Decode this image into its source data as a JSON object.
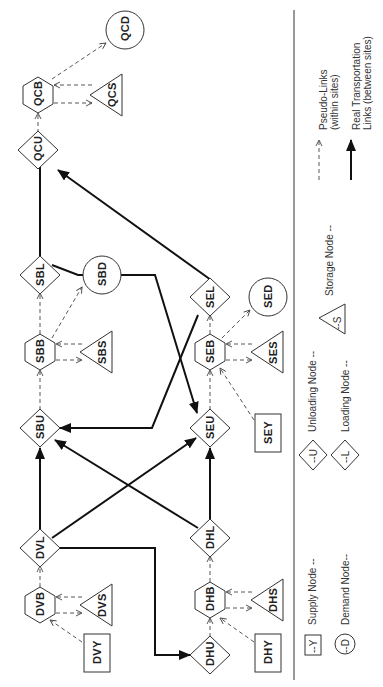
{
  "diagram": {
    "orientation": "rotated-90-ccw",
    "nodes": [
      {
        "id": "QCD",
        "type": "demand",
        "x": 125,
        "y": 30
      },
      {
        "id": "QCB",
        "type": "hub",
        "x": 38,
        "y": 95
      },
      {
        "id": "QCS",
        "type": "storage",
        "x": 107,
        "y": 95
      },
      {
        "id": "QCU",
        "type": "unloading",
        "x": 38,
        "y": 150
      },
      {
        "id": "SBL",
        "type": "loading",
        "x": 40,
        "y": 275
      },
      {
        "id": "SBD",
        "type": "demand",
        "x": 102,
        "y": 275
      },
      {
        "id": "SBB",
        "type": "hub",
        "x": 40,
        "y": 352
      },
      {
        "id": "SBS",
        "type": "storage",
        "x": 97,
        "y": 352
      },
      {
        "id": "SBU",
        "type": "unloading",
        "x": 40,
        "y": 428
      },
      {
        "id": "SEL",
        "type": "loading",
        "x": 210,
        "y": 297
      },
      {
        "id": "SED",
        "type": "demand",
        "x": 268,
        "y": 297
      },
      {
        "id": "SEB",
        "type": "hub",
        "x": 210,
        "y": 352
      },
      {
        "id": "SES",
        "type": "storage",
        "x": 268,
        "y": 352
      },
      {
        "id": "SEU",
        "type": "unloading",
        "x": 210,
        "y": 428
      },
      {
        "id": "SEY",
        "type": "supply",
        "x": 268,
        "y": 433
      },
      {
        "id": "DVL",
        "type": "loading",
        "x": 40,
        "y": 548
      },
      {
        "id": "DVB",
        "type": "hub",
        "x": 40,
        "y": 605
      },
      {
        "id": "DVS",
        "type": "storage",
        "x": 97,
        "y": 605
      },
      {
        "id": "DVY",
        "type": "supply",
        "x": 97,
        "y": 653
      },
      {
        "id": "DHL",
        "type": "loading",
        "x": 210,
        "y": 538
      },
      {
        "id": "DHB",
        "type": "hub",
        "x": 210,
        "y": 600
      },
      {
        "id": "DHS",
        "type": "storage",
        "x": 268,
        "y": 600
      },
      {
        "id": "DHU",
        "type": "unloading",
        "x": 210,
        "y": 655
      },
      {
        "id": "DHY",
        "type": "supply",
        "x": 268,
        "y": 653
      }
    ],
    "pseudo_links": [
      [
        "QCU",
        "QCB"
      ],
      [
        "QCB",
        "QCD"
      ],
      [
        "QCB",
        "QCS"
      ],
      [
        "QCS",
        "QCB"
      ],
      [
        "SBU",
        "SBB"
      ],
      [
        "SBB",
        "SBL"
      ],
      [
        "SBB",
        "SBD"
      ],
      [
        "SBB",
        "SBS"
      ],
      [
        "SBS",
        "SBB"
      ],
      [
        "SEU",
        "SEB"
      ],
      [
        "SEB",
        "SEL"
      ],
      [
        "SEB",
        "SED"
      ],
      [
        "SEB",
        "SES"
      ],
      [
        "SES",
        "SEB"
      ],
      [
        "SEY",
        "SEB"
      ],
      [
        "DVB",
        "DVL"
      ],
      [
        "DVB",
        "DVS"
      ],
      [
        "DVS",
        "DVB"
      ],
      [
        "DVY",
        "DVB"
      ],
      [
        "DHU",
        "DHB"
      ],
      [
        "DHB",
        "DHL"
      ],
      [
        "DHB",
        "DHS"
      ],
      [
        "DHS",
        "DHB"
      ],
      [
        "DHY",
        "DHB"
      ]
    ],
    "real_links": [
      [
        "SBL",
        "QCU"
      ],
      [
        "SEL",
        "QCU"
      ],
      [
        "SBL",
        "SEU"
      ],
      [
        "SEL",
        "SBU"
      ],
      [
        "DVL",
        "SBU"
      ],
      [
        "DVL",
        "SEU"
      ],
      [
        "DHL",
        "SBU"
      ],
      [
        "DHL",
        "SEU"
      ],
      [
        "DVL",
        "DHU"
      ]
    ]
  },
  "legend": {
    "supply": {
      "symbol": "--Y",
      "label": "Supply Node --"
    },
    "demand": {
      "symbol": "--D",
      "label": "Demand Node--"
    },
    "unloading": {
      "symbol": "--U",
      "label": "Unloading Node --"
    },
    "loading": {
      "symbol": "--L",
      "label": "Loading Node --"
    },
    "storage": {
      "symbol": "--S",
      "label": "Storage Node --"
    },
    "pseudo": {
      "line1": "Pseudo-Links",
      "line2": "(within sites)"
    },
    "real": {
      "line1": "Real Transportation",
      "line2": "Links (between sites)"
    }
  }
}
